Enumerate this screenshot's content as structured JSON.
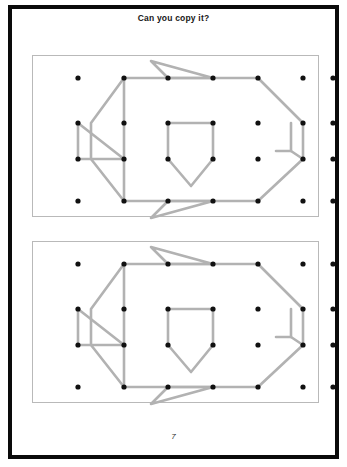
{
  "page": {
    "title": "Can you copy it?",
    "page_number": "7",
    "frame_color": "#0a0a0a",
    "background": "#ffffff"
  },
  "geoboard": {
    "band_color": "#b2b2b2",
    "peg_color": "#111111",
    "panel_border": "#b9b9b9",
    "band_width": 2.6,
    "peg_radius": 2.6,
    "grid": {
      "columns": 7,
      "rows": 4,
      "col_x": [
        45,
        91,
        135,
        180,
        225,
        270,
        300
      ],
      "row_y": [
        22,
        67,
        103,
        145
      ]
    },
    "panels": [
      {
        "name": "model-board",
        "label": "model"
      },
      {
        "name": "copy-board",
        "label": "copy"
      }
    ],
    "shapes": [
      {
        "name": "fish-body-outline",
        "type": "polyline",
        "points": "91,22 135,22 180,22 225,22 270,67 270,103 225,145 180,145 135,145 91,145 58,103 58,67 91,22"
      },
      {
        "name": "tail-triangle",
        "type": "polyline",
        "points": "45,67 91,103 45,103 45,67"
      },
      {
        "name": "tail-spine",
        "type": "line",
        "points": "91,22 91,145"
      },
      {
        "name": "shield-shape",
        "type": "polyline",
        "points": "135,67 180,67 180,103 158,130 135,103 135,67"
      },
      {
        "name": "top-spike-triangle",
        "type": "polyline",
        "points": "135,22 118,5 180,22 135,22"
      },
      {
        "name": "bottom-spike-triangle",
        "type": "polyline",
        "points": "180,145 118,162 135,145 180,145"
      },
      {
        "name": "right-hook",
        "type": "polyline",
        "points": "243,95 258,95 270,103"
      },
      {
        "name": "right-hook-stem",
        "type": "line",
        "points": "258,95 258,67"
      }
    ]
  }
}
